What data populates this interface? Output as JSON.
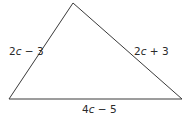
{
  "figure": {
    "type": "triangle",
    "vertices": {
      "top": [
        73,
        3
      ],
      "bottom_left": [
        9,
        99
      ],
      "bottom_right": [
        182,
        99
      ]
    },
    "stroke_color": "#3a3a3a",
    "background": "#ffffff"
  },
  "labels": {
    "left_side": {
      "coef": "2",
      "var": "c",
      "rest": " − 3"
    },
    "right_side": {
      "coef": "2",
      "var": "c",
      "rest": " + 3"
    },
    "bottom_side": {
      "coef": "4",
      "var": "c",
      "rest": " − 5"
    }
  }
}
